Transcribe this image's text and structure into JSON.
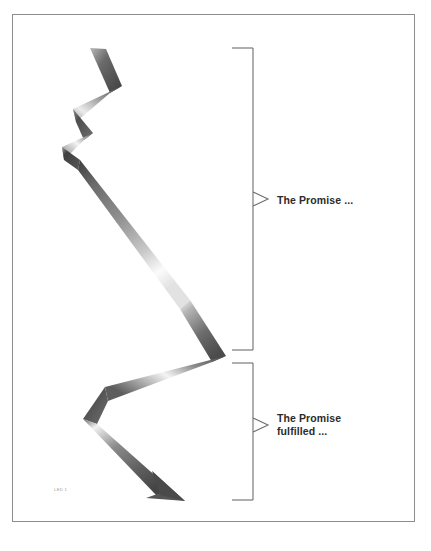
{
  "page": {
    "width": 431,
    "height": 551,
    "background_color": "#ffffff",
    "border_color": "#8d8d8d"
  },
  "figure": {
    "caption": "LED 1",
    "caption_color": "#9a9a9a",
    "diagram_type": "zigzag-ribbon-arrow",
    "arrow_description": "descending zigzag ribbon arrow with grayscale gradient shading",
    "arrow_colors": {
      "dark": "#4a4a4a",
      "mid": "#8a8a8a",
      "light": "#f2f2f2",
      "arrowhead": "#5a5a5a"
    }
  },
  "annotations": {
    "text_color": "#2b2b2b",
    "bracket_color": "#6e6e6e",
    "items": [
      {
        "id": "promise",
        "label": "The Promise ...",
        "bracket_top": 48,
        "bracket_bottom": 350,
        "pointer_y": 199
      },
      {
        "id": "promise-fulfilled",
        "label": "The Promise\nfulfilled ...",
        "bracket_top": 363,
        "bracket_bottom": 500,
        "pointer_y": 425
      }
    ]
  }
}
